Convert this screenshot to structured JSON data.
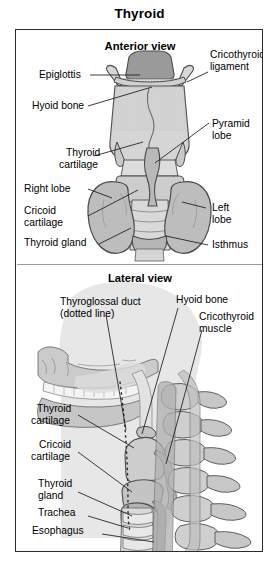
{
  "figure": {
    "title": "Thyroid",
    "panels": [
      {
        "id": "anterior",
        "heading": "Anterior view"
      },
      {
        "id": "lateral",
        "heading": "Lateral view"
      }
    ]
  },
  "anterior_labels": {
    "epiglottis": "Epiglottis",
    "hyoid_bone": "Hyoid bone",
    "cricothyroid_ligament_l1": "Cricothyroid",
    "cricothyroid_ligament_l2": "ligament",
    "pyramid_lobe_l1": "Pyramid",
    "pyramid_lobe_l2": "lobe",
    "thyroid_cartilage_l1": "Thyroid",
    "thyroid_cartilage_l2": "cartilage",
    "right_lobe": "Right lobe",
    "left_lobe_l1": "Left",
    "left_lobe_l2": "lobe",
    "cricoid_cartilage_l1": "Cricoid",
    "cricoid_cartilage_l2": "cartilage",
    "thyroid_gland": "Thyroid gland",
    "isthmus": "Isthmus"
  },
  "lateral_labels": {
    "thyroglossal_duct_l1": "Thyroglossal duct",
    "thyroglossal_duct_l2": "(dotted line)",
    "hyoid_bone": "Hyoid bone",
    "cricothyroid_muscle_l1": "Cricothyroid",
    "cricothyroid_muscle_l2": "muscle",
    "thyroid_cartilage_l1": "Thyroid",
    "thyroid_cartilage_l2": "cartilage",
    "cricoid_cartilage_l1": "Cricoid",
    "cricoid_cartilage_l2": "cartilage",
    "thyroid_gland_l1": "Thyroid",
    "thyroid_gland_l2": "gland",
    "trachea": "Trachea",
    "esophagus": "Esophagus"
  },
  "colors": {
    "ink": "#000000",
    "frame": "#2b2b2b",
    "rule": "#000000",
    "page_bg": "#ffffff",
    "tissue_light": "#dcdcdc",
    "tissue_mid": "#c4c4c4",
    "tissue_dark": "#a8a8a8",
    "tissue_darkest": "#8f8f8f",
    "outline": "#4a4a4a",
    "leader_line": "#1a1a1a"
  }
}
